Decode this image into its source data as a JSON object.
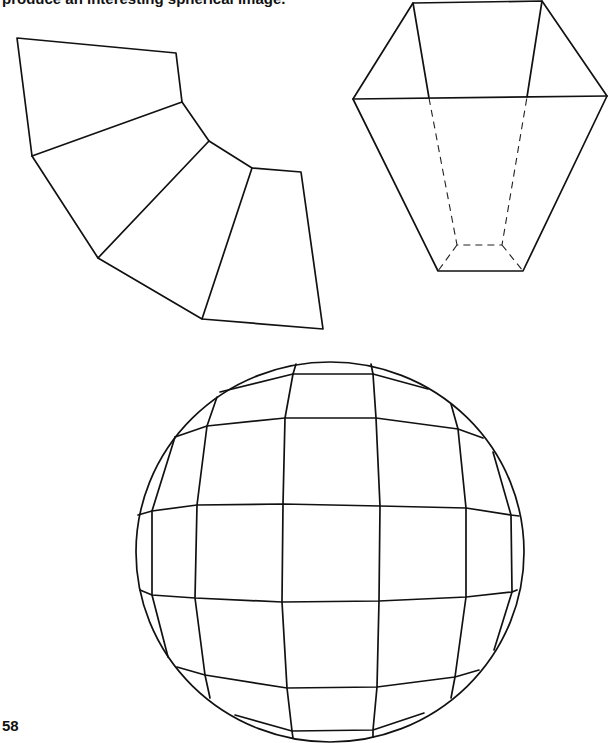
{
  "document": {
    "caption_fragment": "produce an interesting spherical image.",
    "page_number": "58"
  },
  "figures": {
    "fan_net": {
      "description": "Net of four trapezoidal panels arranged in a fan",
      "polylines": [
        [
          [
            17,
            38
          ],
          [
            176,
            53
          ],
          [
            182,
            102
          ],
          [
            32,
            156
          ],
          [
            17,
            38
          ]
        ],
        [
          [
            182,
            102
          ],
          [
            209,
            141
          ],
          [
            98,
            258
          ],
          [
            32,
            156
          ]
        ],
        [
          [
            209,
            141
          ],
          [
            252,
            168
          ],
          [
            202,
            319
          ],
          [
            98,
            258
          ]
        ],
        [
          [
            252,
            168
          ],
          [
            301,
            172
          ],
          [
            323,
            329
          ],
          [
            202,
            319
          ]
        ]
      ]
    },
    "truncated_pyramid": {
      "description": "Inverted truncated pyramid with hidden edges dashed",
      "solid_polylines": [
        [
          [
            413,
            3
          ],
          [
            542,
            1
          ],
          [
            607,
            96
          ],
          [
            523,
            271
          ],
          [
            438,
            271
          ],
          [
            353,
            99
          ],
          [
            413,
            3
          ]
        ],
        [
          [
            353,
            99
          ],
          [
            607,
            96
          ]
        ],
        [
          [
            413,
            3
          ],
          [
            429,
            98
          ]
        ],
        [
          [
            542,
            1
          ],
          [
            527,
            97
          ]
        ]
      ],
      "dashed_polylines": [
        [
          [
            429,
            98
          ],
          [
            457,
            245
          ],
          [
            502,
            245
          ],
          [
            527,
            97
          ]
        ],
        [
          [
            457,
            245
          ],
          [
            438,
            271
          ]
        ],
        [
          [
            502,
            245
          ],
          [
            523,
            271
          ]
        ]
      ]
    },
    "faceted_sphere": {
      "description": "Circle containing a polygonal grid approximating a sphere",
      "outline": {
        "cx": 330,
        "cy": 552,
        "rx": 194,
        "ry": 190
      },
      "polylines": [
        [
          [
            220,
            392
          ],
          [
            293,
            374
          ],
          [
            373,
            374
          ],
          [
            428,
            389
          ]
        ],
        [
          [
            296,
            364
          ],
          [
            293,
            374
          ]
        ],
        [
          [
            371,
            364
          ],
          [
            373,
            374
          ]
        ],
        [
          [
            175,
            437
          ],
          [
            207,
            426
          ],
          [
            285,
            418
          ],
          [
            376,
            418
          ],
          [
            458,
            429
          ],
          [
            483,
            438
          ]
        ],
        [
          [
            217,
            397
          ],
          [
            207,
            426
          ],
          [
            197,
            505
          ],
          [
            195,
            598
          ],
          [
            205,
            675
          ],
          [
            210,
            698
          ]
        ],
        [
          [
            293,
            374
          ],
          [
            285,
            418
          ],
          [
            283,
            504
          ],
          [
            282,
            602
          ],
          [
            287,
            688
          ],
          [
            292,
            731
          ],
          [
            293,
            738
          ]
        ],
        [
          [
            373,
            374
          ],
          [
            376,
            418
          ],
          [
            380,
            506
          ],
          [
            379,
            601
          ],
          [
            377,
            687
          ],
          [
            373,
            730
          ],
          [
            373,
            737
          ]
        ],
        [
          [
            451,
            404
          ],
          [
            458,
            429
          ],
          [
            466,
            508
          ],
          [
            466,
            597
          ],
          [
            455,
            677
          ],
          [
            451,
            698
          ]
        ],
        [
          [
            175,
            437
          ],
          [
            152,
            511
          ],
          [
            152,
            595
          ],
          [
            168,
            657
          ]
        ],
        [
          [
            493,
            452
          ],
          [
            511,
            515
          ],
          [
            512,
            592
          ],
          [
            494,
            650
          ]
        ],
        [
          [
            138,
            515
          ],
          [
            152,
            511
          ],
          [
            197,
            505
          ],
          [
            283,
            504
          ],
          [
            380,
            506
          ],
          [
            466,
            508
          ],
          [
            511,
            515
          ],
          [
            519,
            516
          ]
        ],
        [
          [
            140,
            590
          ],
          [
            152,
            595
          ],
          [
            195,
            598
          ],
          [
            282,
            602
          ],
          [
            379,
            601
          ],
          [
            466,
            597
          ],
          [
            512,
            592
          ],
          [
            517,
            590
          ]
        ],
        [
          [
            177,
            667
          ],
          [
            205,
            675
          ],
          [
            287,
            688
          ],
          [
            377,
            687
          ],
          [
            455,
            677
          ],
          [
            479,
            670
          ]
        ],
        [
          [
            235,
            715
          ],
          [
            292,
            731
          ],
          [
            373,
            730
          ],
          [
            424,
            713
          ]
        ]
      ]
    }
  },
  "colors": {
    "ink": "#111111",
    "paper": "#ffffff"
  }
}
